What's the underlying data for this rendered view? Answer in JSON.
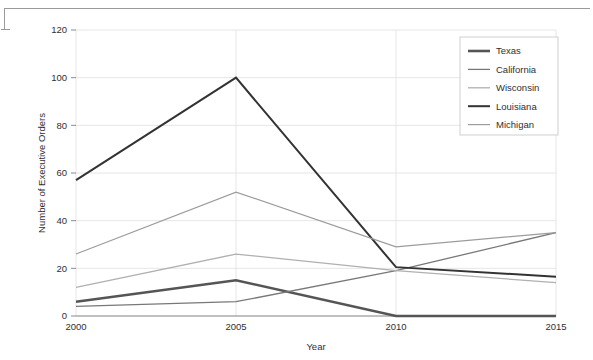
{
  "figure": {
    "border_color": "#9a9a9a",
    "background": "#ffffff"
  },
  "chart_data": {
    "type": "line",
    "title": "",
    "xlabel": "Year",
    "ylabel": "Number of Executive Orders",
    "categories": [
      "2000",
      "2005",
      "2010",
      "2015"
    ],
    "x": [
      2000,
      2005,
      2010,
      2015
    ],
    "xlim": [
      2000,
      2015
    ],
    "ylim": [
      0,
      120
    ],
    "yticks": [
      0,
      20,
      40,
      60,
      80,
      100,
      120
    ],
    "xticks": [
      2000,
      2005,
      2010,
      2015
    ],
    "grid": "horizontal-and-vertical",
    "legend_position": "top-right",
    "series": [
      {
        "name": "Texas",
        "values": [
          6,
          15,
          0,
          0
        ],
        "color": "#555555",
        "width": 2.6
      },
      {
        "name": "California",
        "values": [
          4,
          6,
          19,
          35
        ],
        "color": "#787878",
        "width": 1.3
      },
      {
        "name": "Wisconsin",
        "values": [
          12,
          26,
          19,
          14
        ],
        "color": "#b0b0b0",
        "width": 1.3
      },
      {
        "name": "Louisiana",
        "values": [
          57,
          100,
          20.5,
          16.5
        ],
        "color": "#333333",
        "width": 2.0
      },
      {
        "name": "Michigan",
        "values": [
          26,
          52,
          29,
          35
        ],
        "color": "#9c9c9c",
        "width": 1.2
      }
    ]
  },
  "axes": {
    "y_tick_labels": [
      "0",
      "20",
      "40",
      "60",
      "80",
      "100",
      "120"
    ],
    "x_tick_labels": [
      "2000",
      "2005",
      "2010",
      "2015"
    ],
    "y_axis_title": "Number of Executive Orders",
    "x_axis_title": "Year"
  },
  "legend": {
    "entries": [
      {
        "label": "Texas"
      },
      {
        "label": "California"
      },
      {
        "label": "Wisconsin"
      },
      {
        "label": "Louisiana"
      },
      {
        "label": "Michigan"
      }
    ]
  }
}
